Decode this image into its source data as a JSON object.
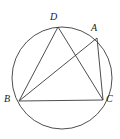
{
  "figure": {
    "background_color": "#ffffff",
    "stroke_color": "#3a3a3a",
    "label_color": "#1a1a1a",
    "stroke_width": 0.9
  },
  "circle": {
    "name": "circumscribed-circle",
    "cx": 62,
    "cy": 78,
    "rx": 50,
    "ry": 51
  },
  "points": [
    {
      "id": "D",
      "label": "D",
      "x": 58,
      "y": 27
    },
    {
      "id": "A",
      "label": "A",
      "x": 97,
      "y": 38
    },
    {
      "id": "B",
      "label": "B",
      "x": 19,
      "y": 101
    },
    {
      "id": "C",
      "label": "C",
      "x": 103,
      "y": 100
    }
  ],
  "segments": [
    {
      "id": "BD",
      "from": "B",
      "to": "D",
      "x1": 19,
      "y1": 101,
      "x2": 58,
      "y2": 27
    },
    {
      "id": "BA",
      "from": "B",
      "to": "A",
      "x1": 19,
      "y1": 101,
      "x2": 97,
      "y2": 38
    },
    {
      "id": "BC",
      "from": "B",
      "to": "C",
      "x1": 19,
      "y1": 101,
      "x2": 103,
      "y2": 100
    },
    {
      "id": "DC",
      "from": "D",
      "to": "C",
      "x1": 58,
      "y1": 27,
      "x2": 103,
      "y2": 100
    },
    {
      "id": "AC",
      "from": "A",
      "to": "C",
      "x1": 97,
      "y1": 38,
      "x2": 103,
      "y2": 100
    }
  ],
  "labels": {
    "D": "D",
    "A": "A",
    "B": "B",
    "C": "C"
  }
}
